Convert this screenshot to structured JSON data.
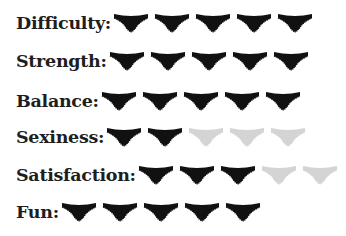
{
  "colors": {
    "filled": "#111111",
    "empty": "#d4d4d4",
    "text": "#1e1e1e"
  },
  "max_rating": 5,
  "icon": "panties-icon",
  "ratings": [
    {
      "label": "Difficulty:",
      "value": 5
    },
    {
      "label": "Strength:",
      "value": 5
    },
    {
      "label": "Balance:",
      "value": 5
    },
    {
      "label": "Sexiness:",
      "value": 2
    },
    {
      "label": "Satisfaction:",
      "value": 3
    },
    {
      "label": "Fun:",
      "value": 5
    }
  ]
}
